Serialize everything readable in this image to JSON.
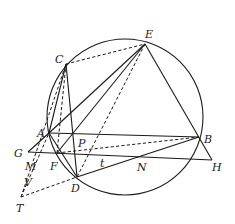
{
  "diagram": {
    "type": "geometry",
    "circle": {
      "cx": 125,
      "cy": 117,
      "r": 78
    },
    "points": {
      "A": {
        "x": 49,
        "y": 133,
        "label": "A",
        "lx": 37,
        "ly": 137
      },
      "B": {
        "x": 199,
        "y": 137,
        "label": "B",
        "lx": 204,
        "ly": 143
      },
      "C": {
        "x": 66,
        "y": 64,
        "label": "C",
        "lx": 55,
        "ly": 63
      },
      "D": {
        "x": 77,
        "y": 177,
        "label": "D",
        "lx": 71,
        "ly": 192
      },
      "E": {
        "x": 145,
        "y": 44,
        "label": "E",
        "lx": 145,
        "ly": 38
      },
      "F": {
        "x": 57,
        "y": 153,
        "label": "F",
        "lx": 50,
        "ly": 170
      },
      "G": {
        "x": 28,
        "y": 152,
        "label": "G",
        "lx": 14,
        "ly": 157
      },
      "H": {
        "x": 212,
        "y": 160,
        "label": "H",
        "lx": 212,
        "ly": 171
      },
      "M": {
        "x": 40,
        "y": 154,
        "label": "M",
        "lx": 25,
        "ly": 170
      },
      "N": {
        "x": 141,
        "y": 156,
        "label": "N",
        "lx": 137,
        "ly": 171
      },
      "P": {
        "x": 73,
        "y": 133,
        "label": "P",
        "lx": 78,
        "ly": 147
      },
      "T": {
        "x": 21,
        "y": 197,
        "label": "T",
        "lx": 16,
        "ly": 212
      },
      "V": {
        "x": 32,
        "y": 176,
        "label": "V",
        "lx": 24,
        "ly": 186
      },
      "t": {
        "label": "t",
        "lx": 100,
        "ly": 167
      }
    },
    "solid_segments": [
      [
        "A",
        "B"
      ],
      [
        "G",
        "H"
      ],
      [
        "E",
        "A"
      ],
      [
        "E",
        "F"
      ],
      [
        "E",
        "H"
      ],
      [
        "C",
        "A"
      ],
      [
        "C",
        "D"
      ],
      [
        "D",
        "B"
      ],
      [
        "G",
        "A"
      ],
      [
        "A",
        "D"
      ]
    ],
    "dashed_segments": [
      [
        "C",
        "E"
      ],
      [
        "C",
        "F"
      ],
      [
        "E",
        "D"
      ],
      [
        "F",
        "B"
      ],
      [
        "T",
        "A"
      ],
      [
        "T",
        "D"
      ],
      [
        "T",
        "C"
      ]
    ]
  }
}
